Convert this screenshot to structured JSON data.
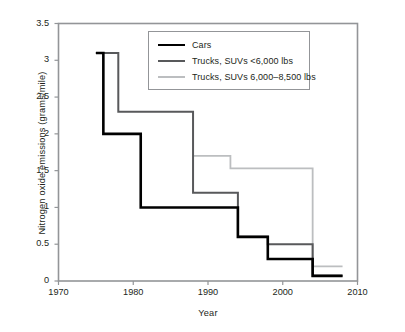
{
  "chart_data": {
    "type": "line",
    "title": "",
    "subtitle": "",
    "xlabel": "Year",
    "ylabel": "Nitrogen oxide emissions (grams/mile)",
    "xlim": [
      1970,
      2010
    ],
    "ylim": [
      0,
      3.5
    ],
    "xticks": [
      1970,
      1980,
      1990,
      2000,
      2010
    ],
    "xticklabels": [
      "1970",
      "1980",
      "1990",
      "2000",
      "2010"
    ],
    "yticks": [
      0,
      0.5,
      1,
      1.5,
      2,
      2.5,
      3,
      3.5
    ],
    "yticklabels": [
      "0",
      "0.5",
      "1",
      "1.5",
      "2",
      "2.5",
      "3",
      "3.5"
    ],
    "grid": false,
    "drawstyle": "steps-post",
    "legend_position": "upper center",
    "series": [
      {
        "name": "Cars",
        "color": "#000000",
        "linewidth": 2.6,
        "x": [
          1975,
          1976,
          1981,
          1993,
          1994,
          1998,
          2004,
          2008
        ],
        "y": [
          3.1,
          2.0,
          1.0,
          1.0,
          0.6,
          0.3,
          0.07,
          0.07
        ]
      },
      {
        "name": "Trucks, SUVs <6,000 lbs",
        "color": "#58595b",
        "linewidth": 2.0,
        "x": [
          1975,
          1978,
          1987,
          1988,
          1994,
          1998,
          2003,
          2004,
          2008
        ],
        "y": [
          3.1,
          2.3,
          2.3,
          1.2,
          0.6,
          0.5,
          0.5,
          0.07,
          0.07
        ]
      },
      {
        "name": "Trucks, SUVs 6,000–8,500 lbs",
        "color": "#bcbec0",
        "linewidth": 1.8,
        "x": [
          1988,
          1992,
          1993,
          2003,
          2004,
          2008
        ],
        "y": [
          1.7,
          1.7,
          1.53,
          1.53,
          0.2,
          0.2
        ]
      }
    ]
  },
  "legend": {
    "items": [
      {
        "label": "Cars",
        "swatch": "cars-line-swatch"
      },
      {
        "label": "Trucks, SUVs <6,000 lbs",
        "swatch": "light-trucks-line-swatch"
      },
      {
        "label": "Trucks, SUVs 6,000–8,500 lbs",
        "swatch": "heavy-trucks-line-swatch"
      }
    ]
  },
  "axes": {
    "x_title": "Year",
    "y_title": "Nitrogen oxide emissions (grams/mile)",
    "x_tick_labels": [
      "1970",
      "1980",
      "1990",
      "2000",
      "2010"
    ],
    "y_tick_labels": [
      "0",
      "0.5",
      "1",
      "1.5",
      "2",
      "2.5",
      "3",
      "3.5"
    ]
  },
  "colors": {
    "cars": "#000000",
    "light_trucks": "#58595b",
    "heavy_trucks": "#bcbec0",
    "frame": "#939598",
    "text": "#231f20"
  }
}
